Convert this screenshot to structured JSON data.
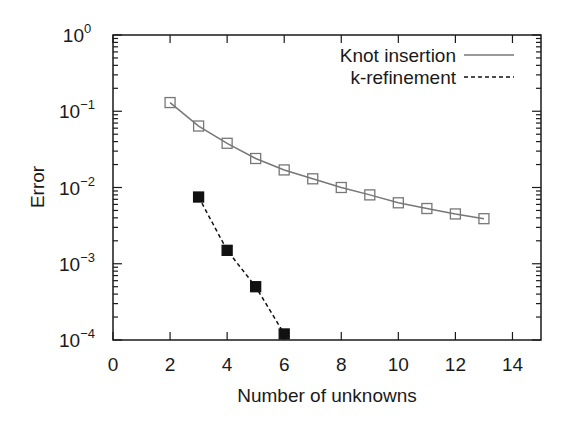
{
  "chart_data": {
    "type": "line",
    "title": "",
    "xlabel": "Number of unknowns",
    "ylabel": "Error",
    "xlim": [
      0,
      15
    ],
    "ylim": [
      0.0001,
      1
    ],
    "yscale": "log",
    "xticks": [
      0,
      2,
      4,
      6,
      8,
      10,
      12,
      14
    ],
    "yticks": [
      {
        "base": "10",
        "exp": "0"
      },
      {
        "base": "10",
        "exp": "-1"
      },
      {
        "base": "10",
        "exp": "-2"
      },
      {
        "base": "10",
        "exp": "-3"
      },
      {
        "base": "10",
        "exp": "-4"
      }
    ],
    "legend_position": "upper right",
    "grid": false,
    "series": [
      {
        "name": "Knot insertion",
        "line_style": "solid",
        "marker": "open-square",
        "color": "#777777",
        "x": [
          2,
          3,
          4,
          5,
          6,
          7,
          8,
          9,
          10,
          11,
          12,
          13
        ],
        "values": [
          0.13,
          0.064,
          0.038,
          0.024,
          0.017,
          0.013,
          0.01,
          0.008,
          0.0063,
          0.0053,
          0.0045,
          0.0039
        ]
      },
      {
        "name": "k-refinement",
        "line_style": "dashed",
        "marker": "filled-square",
        "color": "#111111",
        "x": [
          3,
          4,
          5,
          6
        ],
        "values": [
          0.0075,
          0.0015,
          0.0005,
          0.00012
        ]
      }
    ]
  }
}
